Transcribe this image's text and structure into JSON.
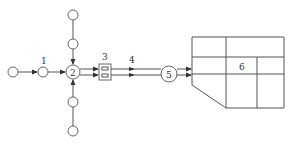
{
  "diagram": {
    "labels": {
      "node1": "1",
      "node2": "2",
      "node3": "3",
      "node4": "4",
      "node5": "5",
      "node6": "6"
    },
    "colors": {
      "line": "#555555",
      "node": "#666666",
      "text": "#333333",
      "background": "#ffffff"
    },
    "nodes": [
      {
        "id": "source-left",
        "shape": "circle",
        "label": ""
      },
      {
        "id": "node1",
        "shape": "circle",
        "label": "1"
      },
      {
        "id": "node2",
        "shape": "circle",
        "label": "2"
      },
      {
        "id": "source-top-1",
        "shape": "circle",
        "label": ""
      },
      {
        "id": "source-top-2",
        "shape": "circle",
        "label": ""
      },
      {
        "id": "source-bottom-1",
        "shape": "circle",
        "label": ""
      },
      {
        "id": "source-bottom-2",
        "shape": "circle",
        "label": ""
      },
      {
        "id": "node3",
        "shape": "box",
        "label": "3"
      },
      {
        "id": "node4",
        "shape": "double-line",
        "label": "4"
      },
      {
        "id": "node5",
        "shape": "circle",
        "label": "5"
      },
      {
        "id": "node6",
        "shape": "building-grid",
        "label": "6"
      }
    ],
    "edges": [
      {
        "from": "source-left",
        "to": "node1",
        "arrow": true
      },
      {
        "from": "node1",
        "to": "node2",
        "arrow": true
      },
      {
        "from": "source-top-1",
        "to": "source-top-2",
        "arrow": false
      },
      {
        "from": "source-top-2",
        "to": "node2",
        "arrow": true
      },
      {
        "from": "source-bottom-2",
        "to": "source-bottom-1",
        "arrow": false
      },
      {
        "from": "source-bottom-1",
        "to": "node2",
        "arrow": true
      },
      {
        "from": "node2",
        "to": "node3",
        "arrow": true,
        "double": true
      },
      {
        "from": "node3",
        "to": "node5",
        "arrow": true,
        "double": true
      },
      {
        "from": "node5",
        "to": "node6",
        "arrow": true,
        "double": true
      }
    ]
  }
}
